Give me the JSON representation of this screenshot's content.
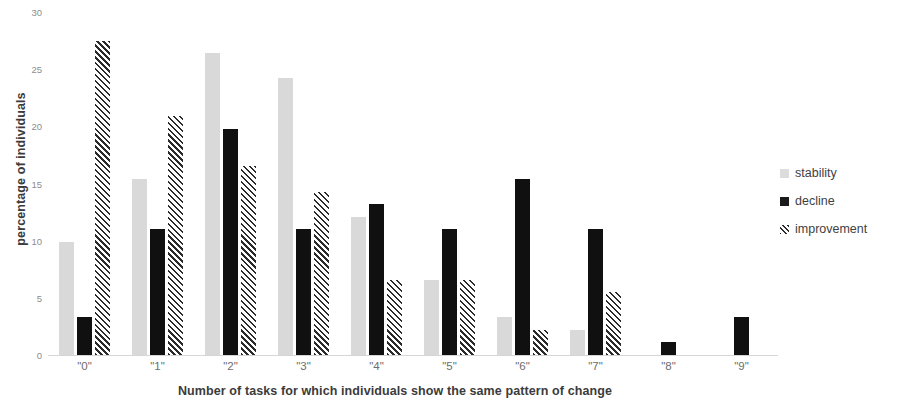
{
  "chart_data": {
    "type": "bar",
    "title": "",
    "xlabel": "Number of tasks for which individuals show the same pattern of change",
    "ylabel": "percentage of individuals",
    "categories": [
      "\"0\"",
      "\"1\"",
      "\"2\"",
      "\"3\"",
      "\"4\"",
      "\"5\"",
      "\"6\"",
      "\"7\"",
      "\"8\"",
      "\"9\""
    ],
    "ylim": [
      0,
      30
    ],
    "yticks": [
      0,
      5,
      10,
      15,
      20,
      25,
      30
    ],
    "grid": false,
    "legend_position": "right",
    "series": [
      {
        "name": "stability",
        "color": "#d9d9d9",
        "pattern": "solid-light-gray",
        "values": [
          9.9,
          15.4,
          26.4,
          24.2,
          12.1,
          6.6,
          3.3,
          2.2,
          0,
          0
        ]
      },
      {
        "name": "decline",
        "color": "#101010",
        "pattern": "solid-black",
        "values": [
          3.3,
          11.0,
          19.8,
          11.0,
          13.2,
          11.0,
          15.4,
          11.0,
          1.1,
          3.3
        ]
      },
      {
        "name": "improvement",
        "color": "#2b2b2b",
        "pattern": "diagonal-hatch",
        "values": [
          27.5,
          20.9,
          16.5,
          14.3,
          6.6,
          6.6,
          2.2,
          5.5,
          0,
          0
        ]
      }
    ]
  },
  "legend": {
    "items": [
      {
        "label": "stability"
      },
      {
        "label": "decline"
      },
      {
        "label": "improvement"
      }
    ]
  }
}
